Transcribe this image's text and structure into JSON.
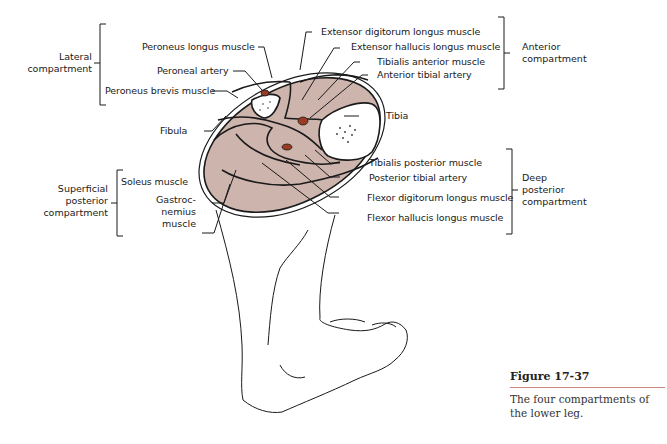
{
  "figure": {
    "number": "Figure 17-37",
    "caption": "The four compartments of the lower leg.",
    "colors": {
      "muscle": "#cdb4ad",
      "artery": "#9a3a22",
      "outline": "#1a1a1a",
      "caption_rule": "#c9867a"
    }
  },
  "groups": {
    "lateral": "Lateral compartment",
    "anterior": "Anterior compartment",
    "superficial_posterior": "Superficial posterior compartment",
    "deep_posterior": "Deep posterior compartment"
  },
  "group_lines": {
    "lateral": [
      "Lateral",
      "compartment"
    ],
    "anterior": [
      "Anterior",
      "compartment"
    ],
    "superficial_posterior": [
      "Superficial",
      "posterior",
      "compartment"
    ],
    "deep_posterior": [
      "Deep",
      "posterior",
      "compartment"
    ]
  },
  "labels": {
    "peroneus_longus": "Peroneus longus muscle",
    "peroneal_artery": "Peroneal artery",
    "peroneus_brevis": "Peroneus brevis muscle",
    "fibula": "Fibula",
    "soleus": "Soleus muscle",
    "gastrocnemius_lines": [
      "Gastroc-",
      "nemius",
      "muscle"
    ],
    "extensor_digitorum": "Extensor digitorum longus muscle",
    "extensor_hallucis": "Extensor hallucis longus muscle",
    "tibialis_anterior": "Tibialis anterior muscle",
    "anterior_tibial_artery": "Anterior tibial artery",
    "tibia": "Tibia",
    "tibialis_posterior": "Tibialis posterior muscle",
    "posterior_tibial_artery": "Posterior tibial artery",
    "flexor_digitorum": "Flexor digitorum longus muscle",
    "flexor_hallucis": "Flexor hallucis longus muscle"
  }
}
